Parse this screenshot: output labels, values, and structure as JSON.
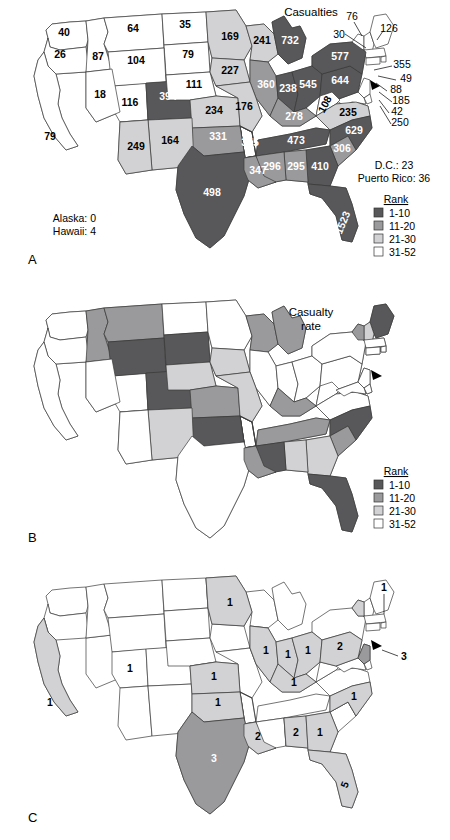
{
  "figure": {
    "panels": [
      {
        "id": "A",
        "letter": "A",
        "title": "Casualties"
      },
      {
        "id": "B",
        "letter": "B",
        "title": "Casualty\nrate"
      },
      {
        "id": "C",
        "letter": "C",
        "title": ""
      }
    ]
  },
  "colors": {
    "rank_1_10": "#58585a",
    "rank_11_20": "#9a9a9c",
    "rank_21_30": "#d2d2d4",
    "rank_31_52": "#ffffff",
    "outline": "#3a3a3a",
    "text_dark": "#000000",
    "text_light": "#ffffff"
  },
  "legend": {
    "title": "Rank",
    "items": [
      {
        "label": "1-10",
        "color": "#58585a"
      },
      {
        "label": "11-20",
        "color": "#9a9a9c"
      },
      {
        "label": "21-30",
        "color": "#d2d2d4"
      },
      {
        "label": "31-52",
        "color": "#ffffff"
      }
    ]
  },
  "panel_a": {
    "title": "Casualties",
    "letter": "A",
    "notes": [
      "Alaska: 0",
      "Hawaii: 4"
    ],
    "side_notes": [
      "D.C.: 23",
      "Puerto Rico: 36"
    ],
    "values": [
      {
        "state": "WA",
        "label": "40",
        "bin": "rank_31_52"
      },
      {
        "state": "OR",
        "label": "26",
        "bin": "rank_31_52"
      },
      {
        "state": "ID",
        "label": "87",
        "bin": "rank_31_52"
      },
      {
        "state": "MT",
        "label": "64",
        "bin": "rank_31_52"
      },
      {
        "state": "ND",
        "label": "35",
        "bin": "rank_31_52"
      },
      {
        "state": "SD",
        "label": "79",
        "bin": "rank_31_52"
      },
      {
        "state": "WY",
        "label": "104",
        "bin": "rank_31_52"
      },
      {
        "state": "NV",
        "label": "18",
        "bin": "rank_31_52"
      },
      {
        "state": "CA",
        "label": "79",
        "bin": "rank_31_52"
      },
      {
        "state": "UT",
        "label": "116",
        "bin": "rank_31_52"
      },
      {
        "state": "CO",
        "label": "394",
        "bin": "rank_1_10"
      },
      {
        "state": "NE",
        "label": "111",
        "bin": "rank_31_52"
      },
      {
        "state": "MN",
        "label": "169",
        "bin": "rank_21_30"
      },
      {
        "state": "IA",
        "label": "227",
        "bin": "rank_21_30"
      },
      {
        "state": "WI",
        "label": "241",
        "bin": "rank_21_30"
      },
      {
        "state": "MI",
        "label": "732",
        "bin": "rank_1_10"
      },
      {
        "state": "IL",
        "label": "360",
        "bin": "rank_11_20"
      },
      {
        "state": "IN",
        "label": "238",
        "bin": "rank_1_10"
      },
      {
        "state": "OH",
        "label": "545",
        "bin": "rank_1_10"
      },
      {
        "state": "PA",
        "label": "644",
        "bin": "rank_1_10"
      },
      {
        "state": "NY",
        "label": "577",
        "bin": "rank_1_10"
      },
      {
        "state": "KS",
        "label": "234",
        "bin": "rank_21_30"
      },
      {
        "state": "MO",
        "label": "176",
        "bin": "rank_21_30"
      },
      {
        "state": "KY",
        "label": "278",
        "bin": "rank_11_20"
      },
      {
        "state": "WV",
        "label": "108",
        "bin": "rank_31_52"
      },
      {
        "state": "VA",
        "label": "235",
        "bin": "rank_21_30"
      },
      {
        "state": "NC",
        "label": "629",
        "bin": "rank_1_10"
      },
      {
        "state": "TN",
        "label": "473",
        "bin": "rank_1_10"
      },
      {
        "state": "SC",
        "label": "306",
        "bin": "rank_11_20"
      },
      {
        "state": "GA",
        "label": "410",
        "bin": "rank_1_10"
      },
      {
        "state": "AL",
        "label": "295",
        "bin": "rank_11_20"
      },
      {
        "state": "MS",
        "label": "296",
        "bin": "rank_11_20"
      },
      {
        "state": "AR",
        "label": "355",
        "bin": "rank_11_20"
      },
      {
        "state": "OK",
        "label": "331",
        "bin": "rank_11_20"
      },
      {
        "state": "NM",
        "label": "164",
        "bin": "rank_21_30"
      },
      {
        "state": "AZ",
        "label": "249",
        "bin": "rank_21_30"
      },
      {
        "state": "TX",
        "label": "498",
        "bin": "rank_1_10"
      },
      {
        "state": "LA",
        "label": "347",
        "bin": "rank_11_20"
      },
      {
        "state": "FL",
        "label": "1523",
        "bin": "rank_1_10"
      }
    ],
    "callouts": [
      {
        "state": "VT",
        "label": "76"
      },
      {
        "state": "NH",
        "label": "30"
      },
      {
        "state": "ME",
        "label": "126"
      },
      {
        "state": "MA",
        "label": "355"
      },
      {
        "state": "RI",
        "label": "49"
      },
      {
        "state": "CT",
        "label": "88"
      },
      {
        "state": "NJ",
        "label": "185"
      },
      {
        "state": "DE",
        "label": "42"
      },
      {
        "state": "MD",
        "label": "250"
      }
    ]
  },
  "panel_b": {
    "title_line1": "Casualty",
    "title_line2": "rate",
    "letter": "B",
    "values": [
      {
        "state": "WA",
        "bin": "rank_31_52"
      },
      {
        "state": "OR",
        "bin": "rank_31_52"
      },
      {
        "state": "ID",
        "bin": "rank_11_20"
      },
      {
        "state": "MT",
        "bin": "rank_11_20"
      },
      {
        "state": "ND",
        "bin": "rank_31_52"
      },
      {
        "state": "SD",
        "bin": "rank_1_10"
      },
      {
        "state": "WY",
        "bin": "rank_1_10"
      },
      {
        "state": "NV",
        "bin": "rank_31_52"
      },
      {
        "state": "CA",
        "bin": "rank_31_52"
      },
      {
        "state": "UT",
        "bin": "rank_11_20"
      },
      {
        "state": "CO",
        "bin": "rank_1_10"
      },
      {
        "state": "NE",
        "bin": "rank_21_30"
      },
      {
        "state": "MN",
        "bin": "rank_31_52"
      },
      {
        "state": "IA",
        "bin": "rank_21_30"
      },
      {
        "state": "WI",
        "bin": "rank_11_20"
      },
      {
        "state": "MI",
        "bin": "rank_11_20"
      },
      {
        "state": "IL",
        "bin": "rank_31_52"
      },
      {
        "state": "IN",
        "bin": "rank_31_52"
      },
      {
        "state": "OH",
        "bin": "rank_31_52"
      },
      {
        "state": "PA",
        "bin": "rank_31_52"
      },
      {
        "state": "NY",
        "bin": "rank_31_52"
      },
      {
        "state": "KS",
        "bin": "rank_11_20"
      },
      {
        "state": "MO",
        "bin": "rank_21_30"
      },
      {
        "state": "KY",
        "bin": "rank_11_20"
      },
      {
        "state": "WV",
        "bin": "rank_31_52"
      },
      {
        "state": "VA",
        "bin": "rank_31_52"
      },
      {
        "state": "NC",
        "bin": "rank_1_10"
      },
      {
        "state": "TN",
        "bin": "rank_11_20"
      },
      {
        "state": "SC",
        "bin": "rank_11_20"
      },
      {
        "state": "GA",
        "bin": "rank_21_30"
      },
      {
        "state": "AL",
        "bin": "rank_21_30"
      },
      {
        "state": "MS",
        "bin": "rank_1_10"
      },
      {
        "state": "AR",
        "bin": "rank_1_10"
      },
      {
        "state": "OK",
        "bin": "rank_1_10"
      },
      {
        "state": "NM",
        "bin": "rank_21_30"
      },
      {
        "state": "AZ",
        "bin": "rank_31_52"
      },
      {
        "state": "TX",
        "bin": "rank_31_52"
      },
      {
        "state": "LA",
        "bin": "rank_11_20"
      },
      {
        "state": "FL",
        "bin": "rank_1_10"
      },
      {
        "state": "ME",
        "bin": "rank_1_10"
      },
      {
        "state": "NH",
        "bin": "rank_21_30"
      },
      {
        "state": "VT",
        "bin": "rank_11_20"
      },
      {
        "state": "MA",
        "bin": "rank_31_52"
      },
      {
        "state": "CT",
        "bin": "rank_31_52"
      },
      {
        "state": "RI",
        "bin": "rank_31_52"
      },
      {
        "state": "NJ",
        "bin": "rank_31_52"
      },
      {
        "state": "DE",
        "bin": "rank_31_52"
      },
      {
        "state": "MD",
        "bin": "rank_31_52"
      }
    ]
  },
  "panel_c": {
    "letter": "C",
    "values": [
      {
        "state": "CA",
        "label": "1",
        "bin": "rank_21_30"
      },
      {
        "state": "UT",
        "label": "1",
        "bin": "rank_21_30"
      },
      {
        "state": "MN",
        "label": "1",
        "bin": "rank_21_30"
      },
      {
        "state": "KS",
        "label": "1",
        "bin": "rank_21_30"
      },
      {
        "state": "OK",
        "label": "1",
        "bin": "rank_21_30"
      },
      {
        "state": "TX",
        "label": "3",
        "bin": "rank_11_20"
      },
      {
        "state": "LA",
        "label": "2",
        "bin": "rank_21_30"
      },
      {
        "state": "IL",
        "label": "1",
        "bin": "rank_21_30"
      },
      {
        "state": "IN",
        "label": "1",
        "bin": "rank_21_30"
      },
      {
        "state": "OH",
        "label": "1",
        "bin": "rank_21_30"
      },
      {
        "state": "KY",
        "label": "1",
        "bin": "rank_21_30"
      },
      {
        "state": "PA",
        "label": "2",
        "bin": "rank_21_30"
      },
      {
        "state": "NJ",
        "label": "3",
        "bin": "rank_11_20"
      },
      {
        "state": "VT",
        "label": "1",
        "bin": "rank_21_30"
      },
      {
        "state": "NC",
        "label": "1",
        "bin": "rank_21_30"
      },
      {
        "state": "AL",
        "label": "2",
        "bin": "rank_21_30"
      },
      {
        "state": "GA",
        "label": "1",
        "bin": "rank_21_30"
      },
      {
        "state": "FL",
        "label": "5",
        "bin": "rank_21_30"
      }
    ]
  }
}
